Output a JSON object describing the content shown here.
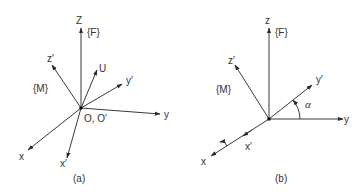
{
  "panel_a": {
    "caption": "(a)",
    "frame_fixed": "{F}",
    "frame_moving": "{M}",
    "origin": "O, O′",
    "axes": {
      "Z": "Z",
      "z_prime": "z′",
      "U": "U",
      "y_prime": "y′",
      "y": "y",
      "x": "x",
      "x_prime": "x′"
    }
  },
  "panel_b": {
    "caption": "(b)",
    "frame_fixed": "{F}",
    "frame_moving": "{M}",
    "angle": "α",
    "axes": {
      "z": "z",
      "z_prime": "z′",
      "y_prime": "y′",
      "y": "y",
      "x": "x",
      "x_prime": "x′"
    }
  }
}
